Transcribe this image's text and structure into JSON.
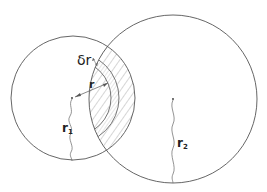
{
  "diagram": {
    "type": "overlapping-circles",
    "labels": {
      "delta_r": "δr",
      "r": "r",
      "r1_main": "r",
      "r1_sub": "1",
      "r2_main": "r",
      "r2_sub": "2"
    },
    "circles": [
      {
        "name": "circle-1",
        "cx": 73,
        "cy": 98,
        "radius": 62,
        "label": "r1"
      },
      {
        "name": "circle-2",
        "cx": 173,
        "cy": 99,
        "radius": 84,
        "label": "r2"
      }
    ],
    "shell": {
      "inner_radius": 38,
      "outer_radius": 46,
      "center": "circle-1"
    },
    "colors": {
      "stroke": "#555555",
      "hatch": "#888888",
      "background": "#ffffff"
    }
  }
}
